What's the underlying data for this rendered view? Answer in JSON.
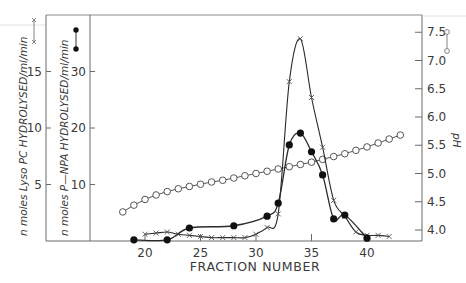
{
  "chart_data": {
    "type": "line",
    "title": "",
    "xlabel": "FRACTION NUMBER",
    "x_ticks": [
      20,
      25,
      30,
      35,
      40
    ],
    "xlim": [
      15,
      43.5
    ],
    "axes": {
      "left_outer": {
        "label": "n moles Lyso PC  HYDROLYSED/ml/min",
        "ticks": [
          5,
          10,
          15
        ],
        "ylim": [
          0,
          18.9
        ],
        "legend_marker": "x—x"
      },
      "left_inner": {
        "label": "n moles P—NPA  HYDROLYSED/ml/min",
        "ticks": [
          10,
          20,
          30
        ],
        "ylim": [
          0,
          37.8
        ],
        "legend_marker": "●—●"
      },
      "right": {
        "label": "pH",
        "ticks": [
          4.0,
          4.5,
          5.0,
          5.5,
          6.0,
          6.5,
          7.0,
          7.5
        ],
        "ylim": [
          3.8,
          7.6
        ],
        "legend_marker": "○—○"
      }
    },
    "grid": false,
    "series": [
      {
        "name": "Lyso PC hydrolysed",
        "axis": "left_outer",
        "marker": "x",
        "x": [
          20,
          21,
          22,
          23,
          24,
          25,
          26,
          27,
          28,
          29,
          30,
          31,
          32,
          33,
          34,
          35,
          36,
          37,
          38,
          39,
          40,
          41,
          42
        ],
        "values": [
          0.6,
          0.7,
          0.8,
          0.6,
          0.5,
          0.4,
          0.3,
          0.3,
          0.3,
          0.3,
          0.6,
          1.2,
          2.4,
          14.1,
          17.9,
          12.7,
          8.3,
          3.6,
          2.2,
          0.8,
          0.5,
          0.5,
          0.4
        ]
      },
      {
        "name": "P-NPA hydrolysed",
        "axis": "left_inner",
        "marker": "filled-circle",
        "x": [
          19,
          22,
          24,
          28,
          31,
          32,
          33,
          34,
          35,
          36,
          37,
          38,
          40
        ],
        "values": [
          0.2,
          0.2,
          2.3,
          2.7,
          4.4,
          6.7,
          17.0,
          19.1,
          15.8,
          11.7,
          3.9,
          4.6,
          0.5
        ]
      },
      {
        "name": "pH",
        "axis": "right",
        "marker": "open-circle",
        "x": [
          18,
          19,
          20,
          21,
          22,
          23,
          24,
          25,
          26,
          27,
          28,
          29,
          30,
          31,
          32,
          33,
          34,
          35,
          36,
          37,
          38,
          39,
          40,
          41,
          42,
          43
        ],
        "values": [
          4.32,
          4.44,
          4.54,
          4.62,
          4.68,
          4.73,
          4.77,
          4.81,
          4.85,
          4.88,
          4.92,
          4.96,
          5.0,
          5.04,
          5.08,
          5.12,
          5.16,
          5.2,
          5.25,
          5.3,
          5.35,
          5.41,
          5.47,
          5.54,
          5.61,
          5.68
        ]
      }
    ]
  }
}
